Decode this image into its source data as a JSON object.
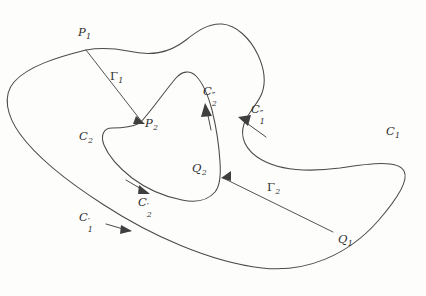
{
  "figure": {
    "background_color": "#fdfdfc",
    "stroke_color": "#4a4a4a",
    "width": 426,
    "height": 296
  },
  "points": [
    {
      "id": "P1",
      "base": "P",
      "sub": "1",
      "x": 78,
      "y": 27,
      "marker_x": 86,
      "marker_y": 50
    },
    {
      "id": "P2",
      "base": "P",
      "sub": "2",
      "x": 145,
      "y": 118,
      "marker_x": 140,
      "marker_y": 123
    },
    {
      "id": "Q2",
      "base": "Q",
      "sub": "2",
      "x": 192,
      "y": 163,
      "marker_x": 222,
      "marker_y": 178
    },
    {
      "id": "Q1",
      "base": "Q",
      "sub": "1",
      "x": 338,
      "y": 234,
      "marker_x": 333,
      "marker_y": 232
    }
  ],
  "curve_labels": [
    {
      "id": "C1",
      "base": "C",
      "sub": "1",
      "primes": "",
      "x": 386,
      "y": 126
    },
    {
      "id": "C2",
      "base": "C",
      "sub": "2",
      "primes": "",
      "x": 79,
      "y": 131
    },
    {
      "id": "C1prime",
      "base": "C",
      "sub": "1",
      "primes": "′",
      "x": 79,
      "y": 212
    },
    {
      "id": "C2prime",
      "base": "C",
      "sub": "2",
      "primes": "′",
      "x": 138,
      "y": 197
    },
    {
      "id": "C1dprime",
      "base": "C",
      "sub": "1",
      "primes": "″",
      "x": 251,
      "y": 104
    },
    {
      "id": "C2dprime",
      "base": "C",
      "sub": "2",
      "primes": "″",
      "x": 203,
      "y": 86
    }
  ],
  "connectors": [
    {
      "id": "Gamma1",
      "label": "Γ",
      "sub": "1",
      "label_x": 110,
      "label_y": 71,
      "from": "P1",
      "to": "P2"
    },
    {
      "id": "Gamma2",
      "label": "Γ",
      "sub": "2",
      "label_x": 267,
      "label_y": 182,
      "from": "Q1",
      "to": "Q2"
    }
  ],
  "paths": {
    "outer_curve_C1": "M 86 50 C 58 57 28 66 14 82 C 2 96 7 116 20 134 C 36 156 68 182 104 205 C 150 235 210 262 262 268 C 306 273 348 255 378 221 C 398 198 409 180 404 171 C 398 160 372 163 340 168 C 310 172 282 171 262 160 C 244 150 240 136 244 124 C 248 112 258 104 262 93 C 266 82 264 68 258 55 C 250 38 236 25 222 24 C 208 23 196 32 186 40 C 168 54 150 56 128 51 C 112 48 98 48 86 50 Z",
    "inner_curve_C2": "M 140 123 C 152 110 164 92 176 78 C 182 71 190 70 196 76 C 203 83 208 95 212 110 C 216 126 219 145 220 162 C 221 176 220 186 215 192 C 208 200 196 203 182 200 C 166 197 148 190 132 178 C 118 167 108 155 104 145 C 100 135 104 128 112 128 C 122 128 132 127 140 123 Z",
    "arrows": [
      {
        "id": "arrow-Gamma1-head",
        "d": "M 136 116 L 145 124 L 133 124 Z"
      },
      {
        "id": "arrow-Gamma2-head",
        "d": "M 231 171 L 221 178 L 231 181 Z"
      },
      {
        "id": "arrow-C1prime",
        "d": "M 106 224 L 130 231"
      },
      {
        "id": "arrow-C1prime-head",
        "d": "M 121 225 L 132 231 L 120 234 Z"
      },
      {
        "id": "arrow-C2prime",
        "d": "M 126 180 L 148 193"
      },
      {
        "id": "arrow-C2prime-head",
        "d": "M 139 185 L 150 194 L 138 194 Z"
      },
      {
        "id": "arrow-C2dprime",
        "d": "M 211 130 L 206 106"
      },
      {
        "id": "arrow-C2dprime-head",
        "d": "M 201 117 L 205 103 L 212 116 Z"
      },
      {
        "id": "arrow-C1dprime",
        "d": "M 266 137 L 241 119"
      },
      {
        "id": "arrow-C1dprime-head",
        "d": "M 251 115 L 238 117 L 248 126 Z"
      }
    ]
  }
}
